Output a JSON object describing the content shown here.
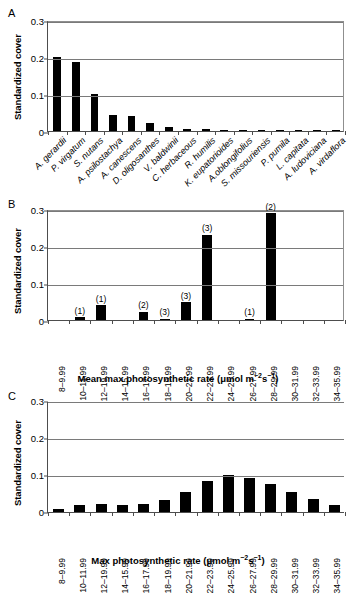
{
  "figure": {
    "panels": [
      "A",
      "B",
      "C"
    ],
    "y_axis_title": "Standardized cover",
    "y_ticks": [
      "0",
      "0.1",
      "0.2",
      "0.3"
    ],
    "y_tick_values": [
      0,
      0.1,
      0.2,
      0.3
    ],
    "bar_color": "#000000",
    "axis_color": "#4d4d4d",
    "grid_color": "#7a7a7a"
  },
  "panelA": {
    "letter": "A",
    "ylabel": "Standardized cover",
    "yticks": [
      "0",
      "0.1",
      "0.2",
      "0.3"
    ],
    "species": [
      "A. gerardii",
      "P. virgatum",
      "S. nutans",
      "A. psilostachya",
      "A. canescens",
      "D. oligosanthes",
      "V. baldwinii",
      "C. herbaceous",
      "R. humilis",
      "K. eupatorioides",
      "A.oblongifolius",
      "S. missouriensis",
      "P. pumila",
      "L. capitata",
      "A. ludoviciana",
      "A. virdaflora"
    ]
  },
  "panelB": {
    "letter": "B",
    "ylabel": "Standardized cover",
    "yticks": [
      "0",
      "0.1",
      "0.2",
      "0.3"
    ],
    "xtitle_main": "Mean max photosynthetic rate (μmol m",
    "xtitle_sup1": "−2",
    "xtitle_mid": "s",
    "xtitle_sup2": "−1",
    "xtitle_end": ")"
  },
  "panelC": {
    "letter": "C",
    "ylabel": "Standardized cover",
    "yticks": [
      "0",
      "0.1",
      "0.2",
      "0.3"
    ],
    "xtitle_main": "Max photosynthetic rate (μmol m",
    "xtitle_sup1": "−2",
    "xtitle_mid": "s",
    "xtitle_sup2": "−1",
    "xtitle_end": ")"
  },
  "chart_data": [
    {
      "type": "bar",
      "panel": "A",
      "title": "",
      "xlabel": "",
      "ylabel": "Standardized cover",
      "ylim": [
        0,
        0.3
      ],
      "grid": true,
      "legend": "none",
      "categories": [
        "A. gerardii",
        "P. virgatum",
        "S. nutans",
        "A. psilostachya",
        "A. canescens",
        "D. oligosanthes",
        "V. baldwinii",
        "C. herbaceous",
        "R. humilis",
        "K. eupatorioides",
        "A.oblongifolius",
        "S. missouriensis",
        "P. pumila",
        "L. capitata",
        "A. ludoviciana",
        "A. virdaflora"
      ],
      "values": [
        0.2,
        0.187,
        0.099,
        0.044,
        0.04,
        0.021,
        0.011,
        0.006,
        0.006,
        0.004,
        0.004,
        0.003,
        0.002,
        0.002,
        0.002,
        0.002
      ],
      "yticks": [
        0,
        0.1,
        0.2,
        0.3
      ]
    },
    {
      "type": "bar",
      "panel": "B",
      "title": "",
      "xlabel": "Mean max photosynthetic rate (μmol m−2s−1)",
      "ylabel": "Standardized cover",
      "ylim": [
        0,
        0.3
      ],
      "grid": true,
      "legend": "none",
      "categories": [
        "8–9.99",
        "10–11.99",
        "12–19.99",
        "14–15.99",
        "16–17.99",
        "18–19.99",
        "20–21.99",
        "22–23.99",
        "24–25.99",
        "26–27.99",
        "28–29.99",
        "30–31.99",
        "32–33.99",
        "34–35.99"
      ],
      "values": [
        0.0,
        0.008,
        0.04,
        0.0,
        0.023,
        0.004,
        0.048,
        0.23,
        0.0,
        0.004,
        0.288,
        0.0,
        0.0,
        0.0
      ],
      "annotations": [
        "",
        "(1)",
        "(1)",
        "",
        "(2)",
        "(3)",
        "(3)",
        "(3)",
        "",
        "(1)",
        "(2)",
        "",
        "",
        ""
      ],
      "yticks": [
        0,
        0.1,
        0.2,
        0.3
      ]
    },
    {
      "type": "bar",
      "panel": "C",
      "title": "",
      "xlabel": "Max photosynthetic rate (μmol m−2s−1)",
      "ylabel": "Standardized cover",
      "ylim": [
        0,
        0.3
      ],
      "grid": true,
      "legend": "none",
      "categories": [
        "8–9.99",
        "10–11.99",
        "12–19.99",
        "14–15.99",
        "16–17.99",
        "18–19.99",
        "20–21.99",
        "22–23.99",
        "24–25.99",
        "26–27.99",
        "28–29.99",
        "30–31.99",
        "32–33.99",
        "34–35.99"
      ],
      "values": [
        0.008,
        0.019,
        0.023,
        0.018,
        0.021,
        0.032,
        0.055,
        0.084,
        0.1,
        0.093,
        0.077,
        0.055,
        0.035,
        0.019
      ],
      "yticks": [
        0,
        0.1,
        0.2,
        0.3
      ]
    }
  ]
}
